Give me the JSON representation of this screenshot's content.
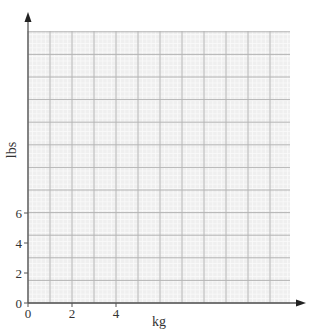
{
  "chart_data": {
    "type": "scatter",
    "title": "",
    "xlabel": "kg",
    "ylabel": "lbs",
    "x_ticks": [
      "0",
      "2",
      "4"
    ],
    "y_ticks": [
      "0",
      "2",
      "4",
      "6"
    ],
    "xlim": [
      0,
      12
    ],
    "ylim": [
      0,
      18
    ],
    "grid": true,
    "series": [],
    "colors": {
      "grid_major": "#b4b4b4",
      "grid_minor": "#e6e6e6",
      "grid_bg": "#efefef",
      "axis": "#555555"
    }
  }
}
